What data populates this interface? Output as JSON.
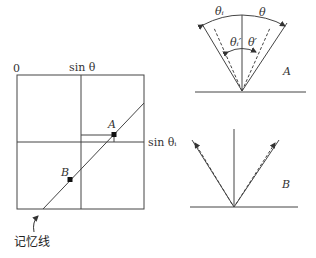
{
  "left_panel": {
    "origin_label": "0",
    "top_axis_label": "sin θ",
    "right_axis_label": "sin θᵢ",
    "point_a_label": "A",
    "point_b_label": "B",
    "memory_line_label": "记忆线"
  },
  "diagram_a": {
    "label": "A",
    "theta_i_label": "θᵢ",
    "theta_label": "θ",
    "theta_i_prime_label": "θᵢ′",
    "theta_prime_label": "θ′"
  },
  "diagram_b": {
    "label": "B"
  },
  "colors": {
    "line": "#444444",
    "text": "#333333"
  }
}
